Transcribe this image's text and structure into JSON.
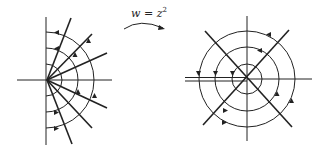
{
  "diagram": {
    "mapping_label": "w = z",
    "mapping_exponent": "2",
    "colors": {
      "stroke": "#222222",
      "background": "#ffffff"
    },
    "left_plane": {
      "description": "z-plane: right half-plane with radial rays and semicircular arcs with direction arrows",
      "origin": [
        47,
        80
      ],
      "axis_vertical": {
        "x": 46,
        "y1": 17,
        "y2": 145
      },
      "axis_horizontal": {
        "y": 80,
        "x1": 17,
        "x2": 112
      },
      "rays_end": [
        [
          71,
          18
        ],
        [
          92,
          34
        ],
        [
          107,
          53
        ],
        [
          107,
          108
        ],
        [
          92,
          128
        ],
        [
          72,
          144
        ]
      ],
      "arc_radii": [
        16,
        32,
        48
      ]
    },
    "right_plane": {
      "description": "w-plane: concentric circles with diagonal lines, branch cut along negative real axis",
      "center": [
        247,
        79
      ],
      "axis_vertical": {
        "x": 247,
        "y1": 16,
        "y2": 141
      },
      "axis_horizontal": {
        "y": 79,
        "x1": 185,
        "x2": 312
      },
      "branch_cut": {
        "y_upper": 77.5,
        "y_lower": 81,
        "x1": 185,
        "x2": 247
      },
      "diagonals": [
        [
          [
            205,
            31
          ],
          [
            292,
            127
          ]
        ],
        [
          [
            289,
            30
          ],
          [
            203,
            125
          ]
        ]
      ],
      "circle_radii": [
        15,
        32,
        48
      ]
    }
  }
}
